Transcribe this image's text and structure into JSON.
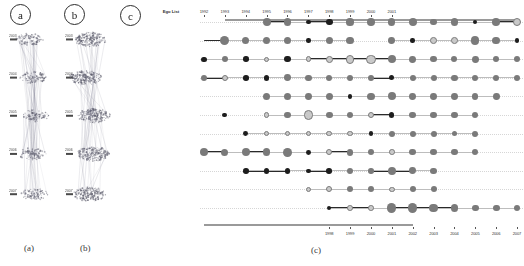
{
  "figure": {
    "panel_badges": [
      {
        "name": "panel-badge-a",
        "label": "a"
      },
      {
        "name": "panel-badge-b",
        "label": "b"
      },
      {
        "name": "panel-badge-c",
        "label": "c"
      }
    ],
    "captions": [
      {
        "name": "caption-a",
        "label": "(a)"
      },
      {
        "name": "caption-b",
        "label": "(b)"
      },
      {
        "name": "caption-c",
        "label": "(c)"
      }
    ]
  },
  "panel_a": {
    "title": "a",
    "caption": "(a)",
    "axis_ticks": [
      "2003",
      "2004",
      "2005",
      "2006",
      "2007"
    ]
  },
  "panel_b": {
    "title": "b",
    "caption": "(b)",
    "axis_ticks": [
      "2003",
      "2004",
      "2005",
      "2006",
      "2007"
    ]
  },
  "panel_c": {
    "title": "c",
    "caption": "(c)",
    "ego_list_header": "Ego List",
    "top_axis_years": [
      "1992",
      "1993",
      "1994",
      "1995",
      "1996",
      "1997",
      "1998",
      "1999",
      "2000",
      "2001"
    ],
    "bottom_axis_years": [
      "1998",
      "1999",
      "2000",
      "2001",
      "2002",
      "2003",
      "2004",
      "2005",
      "2006",
      "2007"
    ],
    "rows": [
      {
        "name": "Hans-Peter Seidel"
      },
      {
        "name": "Luc J. Van Gool"
      },
      {
        "name": "Thomas S. Huang"
      },
      {
        "name": "Kwan-Liu Ma"
      },
      {
        "name": "Markus H. Gross"
      },
      {
        "name": "Daniel Cohen-Or"
      },
      {
        "name": "Edwin R. Hancock"
      },
      {
        "name": "Andrew Zisserman"
      },
      {
        "name": "Harry Shum"
      },
      {
        "name": "Thomas Ertl"
      },
      {
        "name": "Xiaoou Tang"
      }
    ],
    "colors": {
      "node_dark": "#1d1d1d",
      "node_mid": "#7a7a7a",
      "node_light": "#c9c9c9",
      "edge_strong": "#2a2a2a",
      "edge_weak": "#bdbdbd",
      "axis": "#9a9a9a",
      "gridline": "#d6d6d6"
    }
  },
  "chart_data": {
    "type": "scatter",
    "xlabel": "Year",
    "ylabel": "Ego List",
    "grid": true,
    "legend": "none",
    "x_top": [
      1992,
      1993,
      1994,
      1995,
      1996,
      1997,
      1998,
      1999,
      2000,
      2001
    ],
    "x_bottom": [
      1998,
      1999,
      2000,
      2001,
      2002,
      2003,
      2004,
      2005,
      2006,
      2007
    ],
    "categories": [
      "Hans-Peter Seidel",
      "Luc J. Van Gool",
      "Thomas S. Huang",
      "Kwan-Liu Ma",
      "Markus H. Gross",
      "Daniel Cohen-Or",
      "Edwin R. Hancock",
      "Andrew Zisserman",
      "Harry Shum",
      "Thomas Ertl",
      "Xiaoou Tang"
    ],
    "series": [
      {
        "name": "Hans-Peter Seidel",
        "points": [
          {
            "x": 1995,
            "size": 4.0,
            "tone": "mid"
          },
          {
            "x": 1996,
            "size": 3.6,
            "tone": "mid"
          },
          {
            "x": 1997,
            "size": 2.4,
            "tone": "dark"
          },
          {
            "x": 1998,
            "size": 3.4,
            "tone": "dark"
          },
          {
            "x": 1999,
            "size": 3.6,
            "tone": "mid"
          },
          {
            "x": 2000,
            "size": 3.8,
            "tone": "mid"
          },
          {
            "x": 2001,
            "size": 3.6,
            "tone": "mid"
          },
          {
            "x": 2002,
            "size": 4.0,
            "tone": "mid"
          },
          {
            "x": 2003,
            "size": 3.4,
            "tone": "mid"
          },
          {
            "x": 2004,
            "size": 3.6,
            "tone": "mid"
          },
          {
            "x": 2005,
            "size": 2.2,
            "tone": "dark"
          },
          {
            "x": 2006,
            "size": 3.8,
            "tone": "mid"
          },
          {
            "x": 2007,
            "size": 4.2,
            "tone": "light"
          }
        ],
        "links": [
          [
            1995,
            1996
          ],
          [
            1997,
            1998
          ],
          [
            2006,
            2007
          ]
        ]
      },
      {
        "name": "Luc J. Van Gool",
        "points": [
          {
            "x": 1993,
            "size": 4.6,
            "tone": "mid"
          },
          {
            "x": 1994,
            "size": 3.6,
            "tone": "mid"
          },
          {
            "x": 1995,
            "size": 3.8,
            "tone": "mid"
          },
          {
            "x": 1996,
            "size": 3.6,
            "tone": "mid"
          },
          {
            "x": 1997,
            "size": 2.2,
            "tone": "dark"
          },
          {
            "x": 1998,
            "size": 3.6,
            "tone": "mid"
          },
          {
            "x": 1999,
            "size": 3.6,
            "tone": "mid"
          },
          {
            "x": 2001,
            "size": 3.4,
            "tone": "mid"
          },
          {
            "x": 2002,
            "size": 2.2,
            "tone": "dark"
          },
          {
            "x": 2003,
            "size": 3.4,
            "tone": "light"
          },
          {
            "x": 2004,
            "size": 3.4,
            "tone": "light"
          },
          {
            "x": 2005,
            "size": 4.2,
            "tone": "mid"
          },
          {
            "x": 2006,
            "size": 3.8,
            "tone": "mid"
          },
          {
            "x": 2007,
            "size": 2.4,
            "tone": "dark"
          }
        ],
        "links": [
          [
            1992,
            1993
          ],
          [
            1993,
            1994
          ],
          [
            1995,
            1996
          ],
          [
            2001,
            2002
          ],
          [
            2006,
            2007
          ]
        ]
      },
      {
        "name": "Thomas S. Huang",
        "points": [
          {
            "x": 1992,
            "size": 2.6,
            "tone": "dark"
          },
          {
            "x": 1993,
            "size": 3.2,
            "tone": "mid"
          },
          {
            "x": 1994,
            "size": 2.8,
            "tone": "dark"
          },
          {
            "x": 1995,
            "size": 2.6,
            "tone": "light"
          },
          {
            "x": 1996,
            "size": 3.2,
            "tone": "dark"
          },
          {
            "x": 1997,
            "size": 2.8,
            "tone": "light"
          },
          {
            "x": 1998,
            "size": 3.4,
            "tone": "light"
          },
          {
            "x": 1999,
            "size": 4.4,
            "tone": "light"
          },
          {
            "x": 2000,
            "size": 4.6,
            "tone": "light"
          },
          {
            "x": 2001,
            "size": 4.2,
            "tone": "mid"
          },
          {
            "x": 2002,
            "size": 3.4,
            "tone": "mid"
          },
          {
            "x": 2003,
            "size": 3.2,
            "tone": "mid"
          },
          {
            "x": 2004,
            "size": 3.0,
            "tone": "mid"
          },
          {
            "x": 2005,
            "size": 3.4,
            "tone": "mid"
          },
          {
            "x": 2006,
            "size": 3.0,
            "tone": "mid"
          },
          {
            "x": 2007,
            "size": 3.2,
            "tone": "mid"
          }
        ],
        "links": [
          [
            1997,
            1998
          ],
          [
            1998,
            1999
          ],
          [
            1999,
            2000
          ],
          [
            2000,
            2001
          ]
        ]
      },
      {
        "name": "Kwan-Liu Ma",
        "points": [
          {
            "x": 1992,
            "size": 3.2,
            "tone": "mid"
          },
          {
            "x": 1993,
            "size": 3.0,
            "tone": "light"
          },
          {
            "x": 1994,
            "size": 2.8,
            "tone": "dark"
          },
          {
            "x": 1995,
            "size": 2.8,
            "tone": "dark"
          },
          {
            "x": 1996,
            "size": 3.4,
            "tone": "mid"
          },
          {
            "x": 1997,
            "size": 3.2,
            "tone": "mid"
          },
          {
            "x": 1998,
            "size": 3.0,
            "tone": "mid"
          },
          {
            "x": 1999,
            "size": 3.0,
            "tone": "mid"
          },
          {
            "x": 2000,
            "size": 3.0,
            "tone": "mid"
          },
          {
            "x": 2001,
            "size": 2.6,
            "tone": "dark"
          },
          {
            "x": 2002,
            "size": 3.0,
            "tone": "mid"
          },
          {
            "x": 2003,
            "size": 3.0,
            "tone": "mid"
          },
          {
            "x": 2004,
            "size": 3.2,
            "tone": "mid"
          },
          {
            "x": 2005,
            "size": 3.0,
            "tone": "mid"
          },
          {
            "x": 2006,
            "size": 3.0,
            "tone": "mid"
          },
          {
            "x": 2007,
            "size": 3.0,
            "tone": "mid"
          }
        ],
        "links": [
          [
            1992,
            1993
          ],
          [
            2000,
            2001
          ]
        ]
      },
      {
        "name": "Markus H. Gross",
        "points": [
          {
            "x": 1995,
            "size": 3.6,
            "tone": "mid"
          },
          {
            "x": 1996,
            "size": 3.6,
            "tone": "mid"
          },
          {
            "x": 1997,
            "size": 3.4,
            "tone": "mid"
          },
          {
            "x": 1998,
            "size": 3.6,
            "tone": "mid"
          },
          {
            "x": 1999,
            "size": 2.2,
            "tone": "dark"
          },
          {
            "x": 2000,
            "size": 3.6,
            "tone": "mid"
          },
          {
            "x": 2001,
            "size": 4.0,
            "tone": "mid"
          },
          {
            "x": 2002,
            "size": 3.4,
            "tone": "mid"
          },
          {
            "x": 2003,
            "size": 3.4,
            "tone": "mid"
          },
          {
            "x": 2004,
            "size": 3.4,
            "tone": "mid"
          },
          {
            "x": 2005,
            "size": 3.2,
            "tone": "mid"
          },
          {
            "x": 2006,
            "size": 3.4,
            "tone": "mid"
          }
        ],
        "links": [
          [
            2000,
            2001
          ]
        ]
      },
      {
        "name": "Daniel Cohen-Or",
        "points": [
          {
            "x": 1993,
            "size": 2.4,
            "tone": "dark"
          },
          {
            "x": 1995,
            "size": 2.6,
            "tone": "light"
          },
          {
            "x": 1996,
            "size": 3.2,
            "tone": "mid"
          },
          {
            "x": 1997,
            "size": 4.8,
            "tone": "light"
          },
          {
            "x": 1998,
            "size": 3.4,
            "tone": "mid"
          },
          {
            "x": 1999,
            "size": 3.2,
            "tone": "mid"
          },
          {
            "x": 2000,
            "size": 3.0,
            "tone": "light"
          },
          {
            "x": 2001,
            "size": 2.6,
            "tone": "dark"
          },
          {
            "x": 2002,
            "size": 3.2,
            "tone": "mid"
          },
          {
            "x": 2003,
            "size": 3.2,
            "tone": "mid"
          },
          {
            "x": 2004,
            "size": 3.2,
            "tone": "mid"
          },
          {
            "x": 2005,
            "size": 3.0,
            "tone": "mid"
          }
        ],
        "links": [
          [
            2000,
            2001
          ]
        ]
      },
      {
        "name": "Edwin R. Hancock",
        "points": [
          {
            "x": 1994,
            "size": 2.4,
            "tone": "dark"
          },
          {
            "x": 1995,
            "size": 2.8,
            "tone": "light"
          },
          {
            "x": 1996,
            "size": 2.8,
            "tone": "light"
          },
          {
            "x": 1997,
            "size": 2.8,
            "tone": "light"
          },
          {
            "x": 1998,
            "size": 2.8,
            "tone": "light"
          },
          {
            "x": 1999,
            "size": 2.8,
            "tone": "light"
          },
          {
            "x": 2000,
            "size": 2.4,
            "tone": "dark"
          },
          {
            "x": 2001,
            "size": 3.0,
            "tone": "mid"
          },
          {
            "x": 2002,
            "size": 3.0,
            "tone": "mid"
          },
          {
            "x": 2003,
            "size": 3.0,
            "tone": "mid"
          },
          {
            "x": 2004,
            "size": 2.8,
            "tone": "mid"
          },
          {
            "x": 2005,
            "size": 3.0,
            "tone": "mid"
          }
        ],
        "links": [
          [
            1994,
            1995
          ],
          [
            1995,
            1996
          ],
          [
            1996,
            1997
          ],
          [
            1997,
            1998
          ],
          [
            1998,
            1999
          ],
          [
            1999,
            2000
          ]
        ]
      },
      {
        "name": "Andrew Zisserman",
        "points": [
          {
            "x": 1992,
            "size": 4.0,
            "tone": "mid"
          },
          {
            "x": 1993,
            "size": 3.6,
            "tone": "mid"
          },
          {
            "x": 1994,
            "size": 4.0,
            "tone": "mid"
          },
          {
            "x": 1995,
            "size": 3.8,
            "tone": "mid"
          },
          {
            "x": 1996,
            "size": 4.4,
            "tone": "mid"
          },
          {
            "x": 1997,
            "size": 2.4,
            "tone": "dark"
          },
          {
            "x": 1998,
            "size": 3.2,
            "tone": "light"
          },
          {
            "x": 1999,
            "size": 3.4,
            "tone": "mid"
          },
          {
            "x": 2000,
            "size": 3.2,
            "tone": "mid"
          },
          {
            "x": 2001,
            "size": 2.8,
            "tone": "light"
          },
          {
            "x": 2002,
            "size": 3.2,
            "tone": "mid"
          },
          {
            "x": 2003,
            "size": 3.2,
            "tone": "mid"
          },
          {
            "x": 2004,
            "size": 3.2,
            "tone": "mid"
          },
          {
            "x": 2005,
            "size": 3.2,
            "tone": "mid"
          }
        ],
        "links": [
          [
            1992,
            1993
          ],
          [
            1994,
            1995
          ],
          [
            1998,
            1999
          ]
        ]
      },
      {
        "name": "Harry Shum",
        "points": [
          {
            "x": 1994,
            "size": 2.8,
            "tone": "dark"
          },
          {
            "x": 1995,
            "size": 2.8,
            "tone": "dark"
          },
          {
            "x": 1996,
            "size": 2.8,
            "tone": "dark"
          },
          {
            "x": 1997,
            "size": 2.2,
            "tone": "dark"
          },
          {
            "x": 1998,
            "size": 2.8,
            "tone": "dark"
          },
          {
            "x": 1999,
            "size": 3.2,
            "tone": "mid"
          },
          {
            "x": 2000,
            "size": 2.8,
            "tone": "mid"
          },
          {
            "x": 2001,
            "size": 4.0,
            "tone": "mid"
          },
          {
            "x": 2002,
            "size": 3.4,
            "tone": "mid"
          },
          {
            "x": 2003,
            "size": 3.2,
            "tone": "mid"
          }
        ],
        "links": [
          [
            1994,
            1995
          ],
          [
            1995,
            1996
          ],
          [
            1997,
            1998
          ],
          [
            2000,
            2001
          ],
          [
            2001,
            2002
          ]
        ]
      },
      {
        "name": "Thomas Ertl",
        "points": [
          {
            "x": 1997,
            "size": 2.8,
            "tone": "light"
          },
          {
            "x": 1998,
            "size": 3.0,
            "tone": "light"
          },
          {
            "x": 1999,
            "size": 3.0,
            "tone": "mid"
          },
          {
            "x": 2000,
            "size": 3.0,
            "tone": "mid"
          },
          {
            "x": 2001,
            "size": 2.8,
            "tone": "light"
          },
          {
            "x": 2002,
            "size": 3.0,
            "tone": "mid"
          },
          {
            "x": 2003,
            "size": 3.0,
            "tone": "mid"
          }
        ],
        "links": [
          [
            1997,
            1998
          ],
          [
            1998,
            1999
          ]
        ]
      },
      {
        "name": "Xiaoou Tang",
        "points": [
          {
            "x": 1998,
            "size": 2.2,
            "tone": "dark"
          },
          {
            "x": 1999,
            "size": 2.8,
            "tone": "light"
          },
          {
            "x": 2000,
            "size": 2.8,
            "tone": "light"
          },
          {
            "x": 2001,
            "size": 4.6,
            "tone": "mid"
          },
          {
            "x": 2002,
            "size": 4.6,
            "tone": "mid"
          },
          {
            "x": 2003,
            "size": 4.4,
            "tone": "mid"
          },
          {
            "x": 2004,
            "size": 3.6,
            "tone": "mid"
          },
          {
            "x": 2005,
            "size": 3.4,
            "tone": "mid"
          },
          {
            "x": 2006,
            "size": 3.4,
            "tone": "mid"
          },
          {
            "x": 2007,
            "size": 3.4,
            "tone": "mid"
          }
        ],
        "links": [
          [
            1998,
            1999
          ],
          [
            1999,
            2000
          ],
          [
            2001,
            2002
          ],
          [
            2002,
            2003
          ],
          [
            2003,
            2004
          ]
        ]
      }
    ]
  }
}
